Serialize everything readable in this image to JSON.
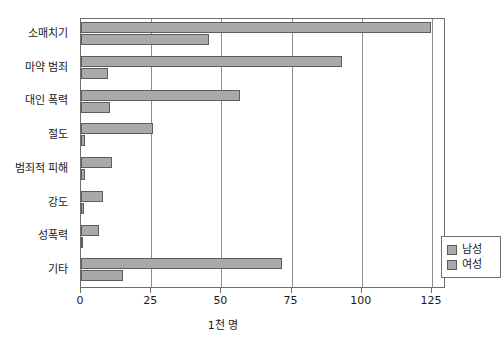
{
  "chart_data": {
    "type": "bar",
    "orientation": "horizontal",
    "title": "",
    "subtitle": "",
    "xlabel": "1천 명",
    "ylabel": "",
    "xlim": [
      0,
      130
    ],
    "xticks": [
      0,
      25,
      50,
      75,
      100,
      125
    ],
    "xtick_labels": [
      "0",
      "25",
      "50",
      "75",
      "100",
      "125"
    ],
    "grid": "vertical",
    "categories": [
      "소매치기",
      "마약 범죄",
      "대인 폭력",
      "절도",
      "범죄적 피해",
      "강도",
      "성폭력",
      "기타"
    ],
    "series": [
      {
        "name": "남성",
        "color": "#a9a9a9",
        "values": [
          124.5,
          93.0,
          56.5,
          25.5,
          11.0,
          8.0,
          6.5,
          71.5
        ]
      },
      {
        "name": "여성",
        "color": "#a9a9a9",
        "values": [
          45.5,
          9.5,
          10.5,
          1.5,
          1.5,
          1.0,
          0.5,
          15.0
        ]
      }
    ],
    "legend": {
      "position": "inside-lower-right",
      "entries": [
        "남성",
        "여성"
      ]
    }
  },
  "colors": {
    "bar_fill": "#a9a9a9",
    "bar_stroke": "#5d5d5d",
    "axis": "#6e6e6e",
    "grid": "#8c8c8c",
    "text": "#1a1a1a",
    "background": "#ffffff"
  }
}
